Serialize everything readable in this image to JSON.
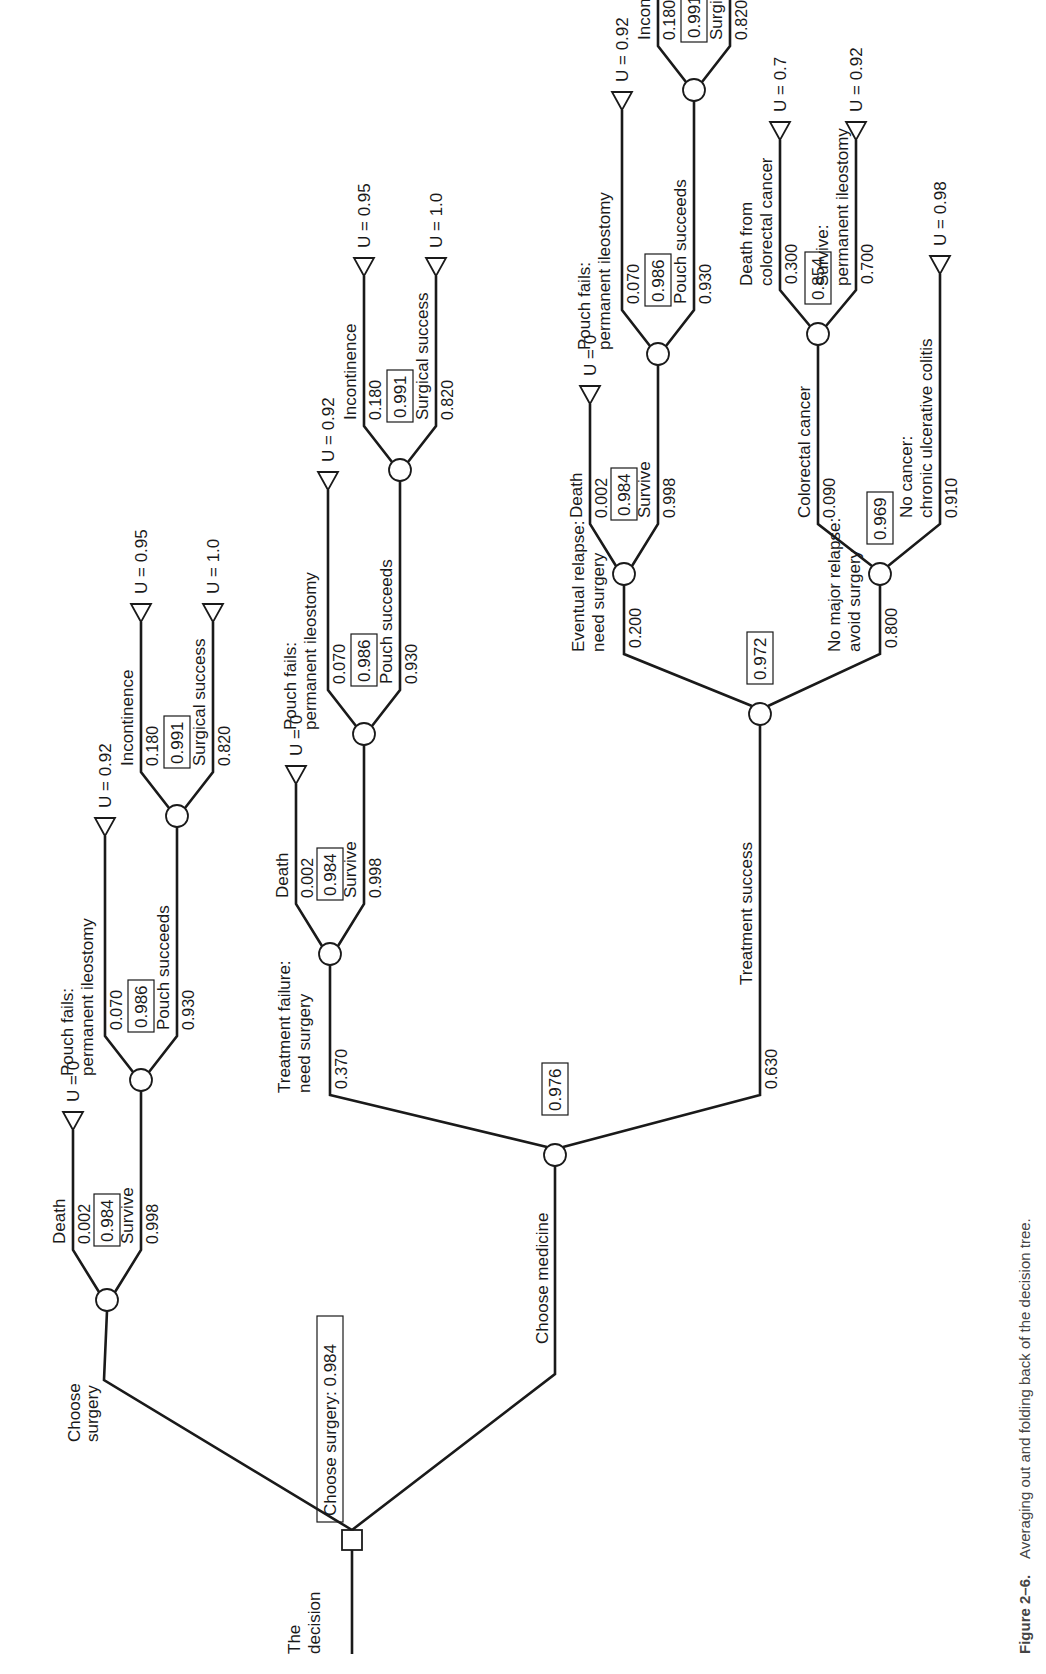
{
  "figure": {
    "caption_label": "Figure 2–6.",
    "caption_text": "Averaging out and folding back of the decision tree."
  },
  "root": {
    "label_line1": "The",
    "label_line2": "decision",
    "result": "Choose surgery: 0.984"
  },
  "surgery": {
    "branch_label_line1": "Choose",
    "branch_label_line2": "surgery",
    "ev": "0.984",
    "death": {
      "label": "Death",
      "prob": "0.002",
      "utility": "U = 0"
    },
    "survive": {
      "label": "Survive",
      "prob": "0.998",
      "ev": "0.986"
    },
    "pouch_fails": {
      "label_line1": "Pouch fails:",
      "label_line2": "permanent ileostomy",
      "prob": "0.070",
      "utility": "U = 0.92"
    },
    "pouch_succeeds": {
      "label": "Pouch succeeds",
      "prob": "0.930",
      "ev": "0.991"
    },
    "incontinence": {
      "label": "Incontinence",
      "prob": "0.180",
      "utility": "U = 0.95"
    },
    "surgical_success": {
      "label": "Surgical success",
      "prob": "0.820",
      "utility": "U = 1.0"
    }
  },
  "medicine": {
    "branch_label": "Choose medicine",
    "ev": "0.976",
    "treatment_failure": {
      "label_line1": "Treatment failure:",
      "label_line2": "need surgery",
      "prob": "0.370",
      "ev": "0.984",
      "death": {
        "label": "Death",
        "prob": "0.002",
        "utility": "U = 0"
      },
      "survive": {
        "label": "Survive",
        "prob": "0.998",
        "ev": "0.986"
      },
      "pouch_fails": {
        "label_line1": "Pouch fails:",
        "label_line2": "permanent ileostomy",
        "prob": "0.070",
        "utility": "U = 0.92"
      },
      "pouch_succeeds": {
        "label": "Pouch succeeds",
        "prob": "0.930",
        "ev": "0.991"
      },
      "incontinence": {
        "label": "Incontinence",
        "prob": "0.180",
        "utility": "U = 0.95"
      },
      "surgical_success": {
        "label": "Surgical success",
        "prob": "0.820",
        "utility": "U = 1.0"
      }
    },
    "treatment_success": {
      "label": "Treatment success",
      "prob": "0.630",
      "ev": "0.972",
      "eventual_relapse": {
        "label_line1": "Eventual relapse:",
        "label_line2": "need surgery",
        "prob": "0.200",
        "ev": "0.984",
        "death": {
          "label": "Death",
          "prob": "0.002",
          "utility": "U = 0"
        },
        "survive": {
          "label": "Survive",
          "prob": "0.998",
          "ev": "0.986"
        },
        "pouch_fails": {
          "label_line1": "Pouch fails:",
          "label_line2": "permanent ileostomy",
          "prob": "0.070",
          "utility": "U = 0.92"
        },
        "pouch_succeeds": {
          "label": "Pouch succeeds",
          "prob": "0.930",
          "ev": "0.991"
        },
        "incontinence": {
          "label": "Incontinence",
          "prob": "0.180",
          "utility": "U = 0.95"
        },
        "surgical_success": {
          "label": "Surgical success",
          "prob": "0.820",
          "utility": "U = 1.0"
        }
      },
      "no_major_relapse": {
        "label_line1": "No major relapse:",
        "label_line2": "avoid surgery",
        "prob": "0.800",
        "ev": "0.969",
        "colorectal_cancer": {
          "label": "Colorectal cancer",
          "prob": "0.090",
          "ev": "0.854"
        },
        "death_from_cancer": {
          "label_line1": "Death from",
          "label_line2": "colorectal cancer",
          "prob": "0.300",
          "utility": "U = 0.7"
        },
        "survive_ileostomy": {
          "label_line1": "Survive:",
          "label_line2": "permanent ileostomy",
          "prob": "0.700",
          "utility": "U = 0.92"
        },
        "no_cancer": {
          "label_line1": "No cancer:",
          "label_line2": "chronic ulcerative colitis",
          "prob": "0.910",
          "utility": "U = 0.98"
        }
      }
    }
  }
}
